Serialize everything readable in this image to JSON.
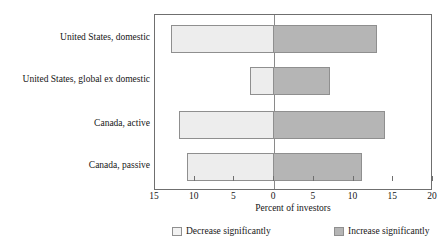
{
  "chart_data": {
    "type": "bar",
    "orientation": "horizontal",
    "title": "",
    "xlabel": "Percent of investors",
    "ylabel": "",
    "xlim": [
      -15,
      20
    ],
    "grid": false,
    "legend_position": "bottom",
    "xticks": [
      {
        "value": -15,
        "label": "15"
      },
      {
        "value": -10,
        "label": "10"
      },
      {
        "value": -5,
        "label": "5"
      },
      {
        "value": 0,
        "label": "0"
      },
      {
        "value": 5,
        "label": "5"
      },
      {
        "value": 10,
        "label": "10"
      },
      {
        "value": 15,
        "label": "15"
      },
      {
        "value": 20,
        "label": "20"
      }
    ],
    "categories": [
      "United States, domestic",
      "United States, global ex domestic",
      "Canada, active",
      "Canada, passive"
    ],
    "series": [
      {
        "name": "Decrease significantly",
        "color": "#ededed",
        "values": [
          -13,
          -3,
          -12,
          -11
        ]
      },
      {
        "name": "Increase significantly",
        "color": "#b5b5b5",
        "values": [
          13,
          7,
          14,
          11
        ]
      }
    ]
  }
}
